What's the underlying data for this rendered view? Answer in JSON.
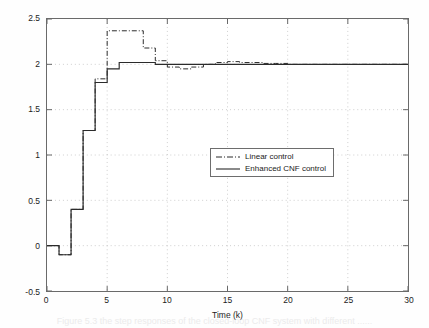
{
  "figure": {
    "background": "#ffffff",
    "frame_color": "#6a6a6a",
    "grid_color": "#b9b9b9",
    "ghost_caption": "Figure 5.3 the step responses of the closed-loop CNF system with different ......"
  },
  "axes": {
    "x_title": "Time (k)",
    "y_title": "Output response",
    "x_ticks": [
      "0",
      "5",
      "10",
      "15",
      "20",
      "25",
      "30"
    ],
    "y_ticks": [
      "2.5",
      "2",
      "1.5",
      "1",
      "0.5",
      "0",
      "-0.5"
    ]
  },
  "legend": {
    "position": "center-right",
    "items": [
      {
        "label": "Linear control",
        "style": "dash-dot",
        "color": "#2b2b2b"
      },
      {
        "label": "Enhanced CNF control",
        "style": "solid",
        "color": "#2b2b2b"
      }
    ]
  },
  "chart_data": {
    "type": "line",
    "title": "",
    "subtitle": "",
    "xlabel": "Time (k)",
    "ylabel": "Output response",
    "xlim": [
      0,
      30
    ],
    "ylim": [
      -0.5,
      2.5
    ],
    "xticks": [
      0,
      5,
      10,
      15,
      20,
      25,
      30
    ],
    "yticks": [
      -0.5,
      0,
      0.5,
      1,
      1.5,
      2,
      2.5
    ],
    "grid": true,
    "grid_style": "dotted",
    "legend_position": "center-right",
    "step_plot": true,
    "x": [
      0,
      1,
      2,
      3,
      4,
      5,
      6,
      7,
      8,
      9,
      10,
      11,
      12,
      13,
      14,
      15,
      16,
      17,
      18,
      19,
      20,
      21,
      22,
      23,
      24,
      25,
      26,
      27,
      28,
      29,
      30
    ],
    "series": [
      {
        "name": "Linear control",
        "style": "dash-dot",
        "color": "#2b2b2b",
        "values": [
          0.0,
          -0.1,
          0.4,
          1.27,
          1.84,
          2.37,
          2.37,
          2.37,
          2.18,
          2.04,
          1.97,
          1.95,
          1.97,
          2.0,
          2.02,
          2.03,
          2.02,
          2.02,
          2.01,
          2.01,
          2.0,
          2.0,
          2.0,
          2.0,
          2.0,
          2.0,
          2.0,
          2.0,
          2.0,
          2.0,
          2.0
        ]
      },
      {
        "name": "Enhanced CNF control",
        "style": "solid",
        "color": "#2b2b2b",
        "values": [
          0.0,
          -0.1,
          0.4,
          1.27,
          1.8,
          1.95,
          2.02,
          2.02,
          2.02,
          2.0,
          2.0,
          2.0,
          2.0,
          2.0,
          2.0,
          2.0,
          2.0,
          2.0,
          2.0,
          2.0,
          2.0,
          2.0,
          2.0,
          2.0,
          2.0,
          2.0,
          2.0,
          2.0,
          2.0,
          2.0,
          2.0
        ]
      }
    ]
  }
}
